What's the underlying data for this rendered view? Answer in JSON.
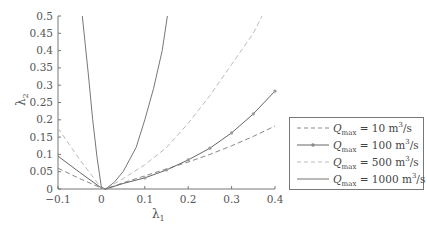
{
  "chart_data": {
    "type": "line",
    "title": "",
    "xlabel": "λ1",
    "ylabel": "λ2",
    "xlim": [
      -0.1,
      0.4
    ],
    "ylim": [
      0,
      0.5
    ],
    "xticks": [
      "-0.1",
      "0",
      "0.1",
      "0.2",
      "0.3",
      "0.4"
    ],
    "yticks": [
      "0",
      "0.05",
      "0.1",
      "0.15",
      "0.2",
      "0.25",
      "0.3",
      "0.35",
      "0.4",
      "0.45",
      "0.5"
    ],
    "grid": false,
    "legend_position": "right",
    "series": [
      {
        "name": "Qmax = 10 m3/s",
        "style": "dashed",
        "color": "#888888",
        "x": [
          -0.1,
          -0.05,
          0,
          0.01,
          0.05,
          0.1,
          0.15,
          0.2,
          0.25,
          0.3,
          0.35,
          0.4
        ],
        "y": [
          0.06,
          0.03,
          0.003,
          0.0,
          0.018,
          0.038,
          0.058,
          0.078,
          0.1,
          0.125,
          0.152,
          0.182
        ]
      },
      {
        "name": "Qmax = 100 m3/s",
        "style": "solid-marker",
        "color": "#666666",
        "x": [
          -0.1,
          -0.05,
          0,
          0.01,
          0.05,
          0.1,
          0.15,
          0.2,
          0.25,
          0.3,
          0.35,
          0.4
        ],
        "y": [
          0.095,
          0.048,
          0.003,
          0.0,
          0.016,
          0.032,
          0.055,
          0.084,
          0.118,
          0.162,
          0.217,
          0.283
        ]
      },
      {
        "name": "Qmax = 500 m3/s",
        "style": "dashed",
        "color": "#bbbbbb",
        "x": [
          -0.1,
          -0.05,
          0,
          0.01,
          0.05,
          0.1,
          0.15,
          0.2,
          0.25,
          0.3,
          0.35,
          0.37
        ],
        "y": [
          0.176,
          0.085,
          0.003,
          0.0,
          0.03,
          0.07,
          0.12,
          0.19,
          0.27,
          0.36,
          0.45,
          0.5
        ]
      },
      {
        "name": "Qmax = 1000 m3/s",
        "style": "solid",
        "color": "#777777",
        "x": [
          -0.044,
          -0.03,
          -0.02,
          -0.01,
          0,
          0.01,
          0.03,
          0.05,
          0.08,
          0.1,
          0.12,
          0.14,
          0.152
        ],
        "y": [
          0.5,
          0.33,
          0.2,
          0.09,
          0.005,
          0.0,
          0.02,
          0.05,
          0.12,
          0.2,
          0.29,
          0.4,
          0.5
        ]
      }
    ]
  },
  "legend": {
    "items": [
      {
        "q": "Q",
        "sub": "max",
        "eq": " = 10 m",
        "sup": "3",
        "unit": "/s"
      },
      {
        "q": "Q",
        "sub": "max",
        "eq": " = 100 m",
        "sup": "3",
        "unit": "/s"
      },
      {
        "q": "Q",
        "sub": "max",
        "eq": " = 500 m",
        "sup": "3",
        "unit": "/s"
      },
      {
        "q": "Q",
        "sub": "max",
        "eq": " = 1000 m",
        "sup": "3",
        "unit": "/s"
      }
    ]
  },
  "axes": {
    "xlabel_main": "λ",
    "xlabel_sub": "1",
    "ylabel_main": "λ",
    "ylabel_sub": "2"
  }
}
